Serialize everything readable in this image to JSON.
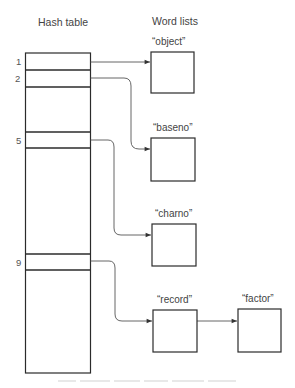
{
  "diagram": {
    "hash_table_title": "Hash table",
    "word_lists_title": "Word lists",
    "slots": [
      {
        "index": "1",
        "word": "“object”"
      },
      {
        "index": "2",
        "word": "“baseno”"
      },
      {
        "index": "5",
        "word": "“charno”"
      },
      {
        "index": "9",
        "word": "“record”",
        "next": "“factor”"
      }
    ],
    "caption": ""
  },
  "colors": {
    "line": "#2b2b2b",
    "arrow": "#555555",
    "text": "#444444"
  }
}
